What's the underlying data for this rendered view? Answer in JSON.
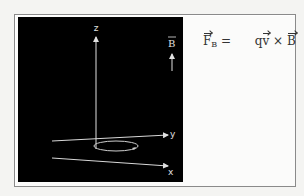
{
  "diagram": {
    "axes": {
      "z_label": "z",
      "y_label": "y",
      "x_label": "x"
    },
    "field": {
      "label": "B",
      "direction": "up"
    },
    "colors": {
      "background": "#000000",
      "lines": "#e0e0e0",
      "frame": "#8a8a8a"
    }
  },
  "formula": {
    "lhs_symbol": "F",
    "lhs_subscript": "B",
    "equals": "=",
    "charge": "q",
    "velocity": "v",
    "cross": "×",
    "field": "B"
  }
}
